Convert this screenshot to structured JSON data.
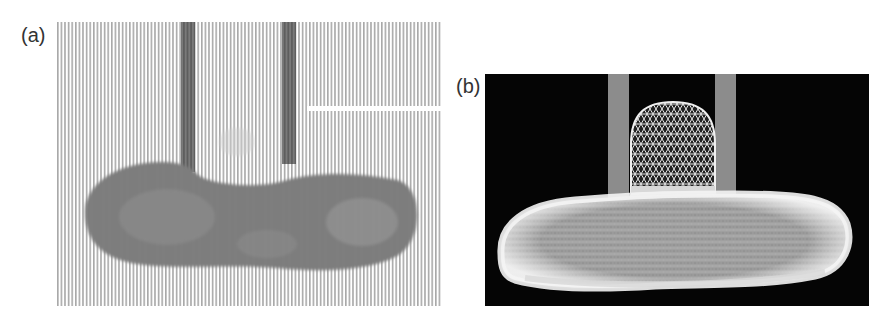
{
  "figure": {
    "panels": [
      {
        "label": "(a)",
        "description": "Experimental image: liquid droplet pinned between two vertical tubes, shown with vertical fringe/stripe pattern",
        "background": "#ffffff",
        "stripe_color": "#9a9a9a",
        "droplet_color": "#6e6e6e",
        "tube_color": "#5e5e5e"
      },
      {
        "label": "(b)",
        "description": "Simulated triangulated wireframe mesh of the droplet between two vertical tubes",
        "background": "#050505",
        "mesh_color": "#e8e8e8",
        "tube_color": "#8c8c8c"
      }
    ]
  }
}
